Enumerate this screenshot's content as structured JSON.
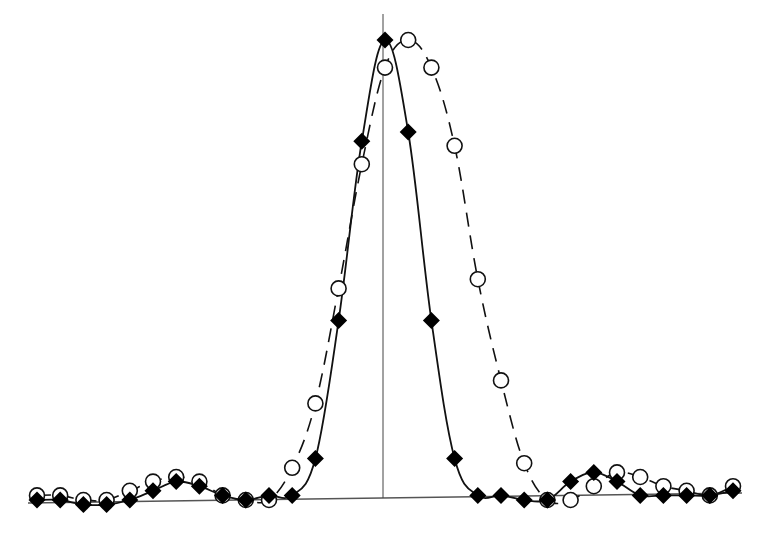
{
  "chart_data": {
    "type": "line",
    "title": "",
    "xlabel": "",
    "ylabel": "",
    "grid": false,
    "legend": null,
    "ylim": [
      0,
      1
    ],
    "x": [
      -15,
      -14,
      -13,
      -12,
      -11,
      -10,
      -9,
      -8,
      -7,
      -6,
      -5,
      -4,
      -3,
      -2,
      -1,
      0,
      1,
      2,
      3,
      4,
      5,
      6,
      7,
      8,
      9,
      10,
      11,
      12,
      13,
      14,
      15
    ],
    "series": [
      {
        "name": "solid-diamonds",
        "marker": "diamond-filled",
        "line": "solid",
        "values": [
          0.0,
          0.0,
          -0.01,
          -0.01,
          0.0,
          0.02,
          0.04,
          0.03,
          0.01,
          0.0,
          0.01,
          0.01,
          0.09,
          0.39,
          0.78,
          1.0,
          0.8,
          0.39,
          0.09,
          0.01,
          0.01,
          0.0,
          0.0,
          0.04,
          0.06,
          0.04,
          0.01,
          0.01,
          0.01,
          0.01,
          0.02
        ]
      },
      {
        "name": "dashed-circles",
        "marker": "circle-open",
        "line": "dashed",
        "values": [
          0.01,
          0.01,
          0.0,
          0.0,
          0.02,
          0.04,
          0.05,
          0.04,
          0.01,
          0.0,
          0.0,
          0.07,
          0.21,
          0.46,
          0.73,
          0.94,
          1.0,
          0.94,
          0.77,
          0.48,
          0.26,
          0.08,
          0.0,
          0.0,
          0.03,
          0.06,
          0.05,
          0.03,
          0.02,
          0.01,
          0.03
        ]
      }
    ],
    "annotations": [
      "vertical center line at x=0"
    ]
  },
  "plot": {
    "width": 767,
    "height": 534,
    "x_px_start": 37,
    "x_px_step": 23.2,
    "baseline_px": 500,
    "peak_px": 40,
    "center_line_x": 383,
    "colors": {
      "ink": "#000000",
      "background": "#ffffff"
    }
  }
}
